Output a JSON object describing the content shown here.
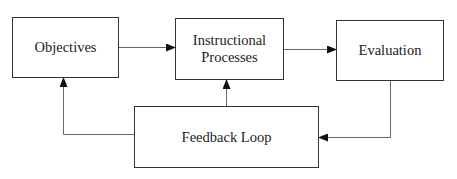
{
  "diagram": {
    "nodes": [
      {
        "id": "objectives",
        "lines": [
          "Objectives"
        ]
      },
      {
        "id": "instructional",
        "lines": [
          "Instructional",
          "Processes"
        ]
      },
      {
        "id": "evaluation",
        "lines": [
          "Evaluation"
        ]
      },
      {
        "id": "feedback",
        "lines": [
          "Feedback Loop"
        ]
      }
    ],
    "edges": [
      {
        "from": "objectives",
        "to": "instructional"
      },
      {
        "from": "instructional",
        "to": "evaluation"
      },
      {
        "from": "evaluation",
        "to": "feedback"
      },
      {
        "from": "feedback",
        "to": "instructional"
      },
      {
        "from": "feedback",
        "to": "objectives"
      }
    ],
    "colors": {
      "line": "#555555",
      "border": "#333333",
      "arrowhead": "#111111"
    }
  }
}
